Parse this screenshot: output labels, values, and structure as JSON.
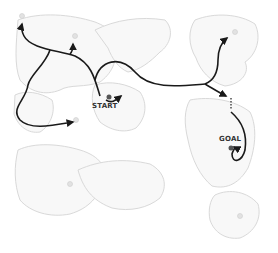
{
  "diagram": {
    "type": "route-map",
    "labels": {
      "start": "START",
      "goal": "GOAL"
    },
    "colors": {
      "path": "#1a1a1a",
      "land_outline": "#d8d8d8",
      "land_fill": "#f7f7f7",
      "marker": "#555555",
      "background": "#ffffff"
    },
    "nodes": [
      {
        "id": "start",
        "label": "START"
      },
      {
        "id": "goal",
        "label": "GOAL"
      },
      {
        "id": "waypoint-northwest",
        "label": ""
      },
      {
        "id": "waypoint-north",
        "label": ""
      },
      {
        "id": "waypoint-southwest",
        "label": ""
      },
      {
        "id": "waypoint-northeast",
        "label": ""
      },
      {
        "id": "waypoint-east",
        "label": ""
      }
    ]
  }
}
